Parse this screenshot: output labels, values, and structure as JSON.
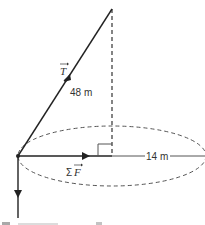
{
  "diagram": {
    "colors": {
      "line": "#222222",
      "dashed": "#444444",
      "text": "#333333"
    },
    "labels": {
      "tension": "T",
      "length": "48 m",
      "net_force_sigma": "Σ",
      "net_force": "F",
      "radius": "14 m",
      "bottom_cut": "F⃗g = mg"
    },
    "vectors": [
      {
        "name": "tension",
        "label": "T",
        "direction": "up-right along string"
      },
      {
        "name": "net-force",
        "label": "ΣF",
        "direction": "horizontal toward center"
      },
      {
        "name": "gravity",
        "label": "Fg",
        "direction": "down"
      }
    ],
    "geometry": {
      "string_length_m": 48,
      "circle_radius_m": 14,
      "right_angle_marker": true
    }
  }
}
